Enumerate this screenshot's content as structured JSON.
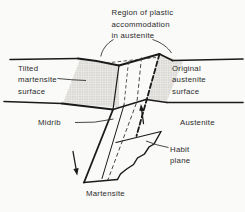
{
  "diagram": {
    "title_label": {
      "line1": "Region of plastic",
      "line2": "accommodation",
      "line3": "in austenite"
    },
    "labels": {
      "tilted": {
        "line1": "Tilted",
        "line2": "martensite",
        "line3": "surface"
      },
      "original": {
        "line1": "Original",
        "line2": "austenite",
        "line3": "surface"
      },
      "midrib": "Midrib",
      "austenite": "Austenite",
      "habit": {
        "line1": "Habit",
        "line2": "plane"
      },
      "martensite": "Martensite"
    },
    "colors": {
      "line": "#1a1a1a",
      "text": "#2b2b2b",
      "stipple_dot": "#8a8a8a",
      "stipple_base": "#e9e8e4",
      "background": "#fafaf8"
    }
  }
}
